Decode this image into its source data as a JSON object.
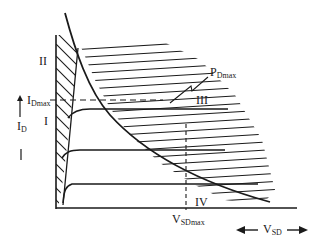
{
  "diagram": {
    "type": "mosfet-safe-operating-area",
    "axes": {
      "y_label": "I",
      "y_label_sub": "D",
      "x_label": "V",
      "x_label_sub": "SD"
    },
    "limits": {
      "id_max": "I",
      "id_max_sub": "Dmax",
      "vsd_max": "V",
      "vsd_max_sub": "SDmax",
      "pd_max": "P",
      "pd_max_sub": "Dmax"
    },
    "regions": [
      {
        "id": "I",
        "label": "I"
      },
      {
        "id": "II",
        "label": "II"
      },
      {
        "id": "III",
        "label": "III"
      },
      {
        "id": "IV",
        "label": "IV"
      }
    ],
    "colors": {
      "ink": "#1a1a1a",
      "background": "#ffffff"
    }
  }
}
